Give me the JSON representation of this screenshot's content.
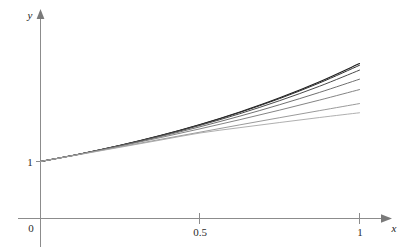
{
  "figure": {
    "background_color": "#ffffff",
    "axis_color": "#8c8c8c",
    "text_color": "#1a1a1a"
  },
  "axes": {
    "x_axis_label": "x",
    "y_axis_label": "y",
    "origin_label": "0",
    "x_ticks": [
      {
        "value": 0.5,
        "label": "0.5"
      },
      {
        "value": 1,
        "label": "1"
      }
    ],
    "y_ticks": [
      {
        "value": 1,
        "label": "1"
      }
    ]
  },
  "chart_data": {
    "type": "line",
    "title": "",
    "subtitle": "",
    "xlabel": "x",
    "ylabel": "y",
    "xlim": [
      0,
      1.08
    ],
    "ylim": [
      0,
      3.0
    ],
    "grid": false,
    "legend": "none",
    "x": [
      0,
      0.125,
      0.25,
      0.375,
      0.5,
      0.625,
      0.75,
      0.875,
      1
    ],
    "annotations": [],
    "series": [
      {
        "name": "curve-1",
        "color": "#1c1c1c",
        "width": 1.1,
        "values": [
          1,
          1.133,
          1.284,
          1.455,
          1.649,
          1.869,
          2.117,
          2.399,
          2.718
        ]
      },
      {
        "name": "curve-2",
        "color": "#2e2e2e",
        "width": 1.0,
        "values": [
          1,
          1.133,
          1.283,
          1.453,
          1.645,
          1.862,
          2.105,
          2.379,
          2.688
        ]
      },
      {
        "name": "curve-3",
        "color": "#4a4a4a",
        "width": 1.0,
        "values": [
          1,
          1.133,
          1.281,
          1.447,
          1.633,
          1.839,
          2.068,
          2.321,
          2.603
        ]
      },
      {
        "name": "curve-4",
        "color": "#606060",
        "width": 0.9,
        "values": [
          1,
          1.132,
          1.277,
          1.436,
          1.609,
          1.796,
          1.997,
          2.213,
          2.444
        ]
      },
      {
        "name": "curve-5",
        "color": "#767676",
        "width": 0.9,
        "values": [
          1,
          1.131,
          1.271,
          1.418,
          1.573,
          1.734,
          1.902,
          2.078,
          2.262
        ]
      },
      {
        "name": "curve-6",
        "color": "#8e8e8e",
        "width": 0.9,
        "values": [
          1,
          1.128,
          1.258,
          1.387,
          1.515,
          1.643,
          1.769,
          1.893,
          2.016
        ]
      },
      {
        "name": "curve-7",
        "color": "#a6a6a6",
        "width": 0.9,
        "values": [
          1,
          1.125,
          1.25,
          1.375,
          1.5,
          1.594,
          1.684,
          1.772,
          1.855
        ]
      }
    ]
  }
}
